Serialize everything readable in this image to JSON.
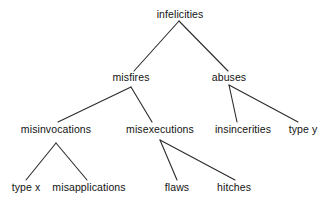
{
  "diagram": {
    "type": "tree",
    "background_color": "#ffffff",
    "line_color": "#2b2b2b",
    "text_color": "#121212",
    "nodes": [
      {
        "id": "infelicities",
        "label": "infelicities",
        "x": 180,
        "y": 14,
        "level": 0
      },
      {
        "id": "misfires",
        "label": "misfires",
        "x": 131,
        "y": 77,
        "level": 1
      },
      {
        "id": "abuses",
        "label": "abuses",
        "x": 229,
        "y": 77,
        "level": 1
      },
      {
        "id": "misinvocations",
        "label": "misinvocations",
        "x": 56,
        "y": 129,
        "level": 2
      },
      {
        "id": "misexecutions",
        "label": "misexecutions",
        "x": 160,
        "y": 129,
        "level": 2
      },
      {
        "id": "insincerities",
        "label": "insincerities",
        "x": 243,
        "y": 129,
        "level": 2
      },
      {
        "id": "type-y",
        "label": "type y",
        "x": 303,
        "y": 129,
        "level": 2
      },
      {
        "id": "type-x",
        "label": "type x",
        "x": 26,
        "y": 187,
        "level": 3
      },
      {
        "id": "misapplications",
        "label": "misapplications",
        "x": 89,
        "y": 187,
        "level": 3
      },
      {
        "id": "flaws",
        "label": "flaws",
        "x": 177,
        "y": 187,
        "level": 3
      },
      {
        "id": "hitches",
        "label": "hitches",
        "x": 234,
        "y": 187,
        "level": 3
      }
    ],
    "edges": [
      {
        "from": "infelicities",
        "to": "misfires",
        "x1": 179,
        "y1": 21,
        "x2": 134,
        "y2": 71
      },
      {
        "from": "infelicities",
        "to": "abuses",
        "x1": 179,
        "y1": 21,
        "x2": 228,
        "y2": 71
      },
      {
        "from": "misfires",
        "to": "misinvocations",
        "x1": 131,
        "y1": 87,
        "x2": 58,
        "y2": 122
      },
      {
        "from": "misfires",
        "to": "misexecutions",
        "x1": 131,
        "y1": 87,
        "x2": 152,
        "y2": 122
      },
      {
        "from": "abuses",
        "to": "insincerities",
        "x1": 229,
        "y1": 85,
        "x2": 237,
        "y2": 122
      },
      {
        "from": "abuses",
        "to": "type-y",
        "x1": 229,
        "y1": 85,
        "x2": 298,
        "y2": 122
      },
      {
        "from": "misinvocations",
        "to": "type-x",
        "x1": 56,
        "y1": 143,
        "x2": 26,
        "y2": 180
      },
      {
        "from": "misinvocations",
        "to": "misapplications",
        "x1": 56,
        "y1": 143,
        "x2": 87,
        "y2": 180
      },
      {
        "from": "misexecutions",
        "to": "flaws",
        "x1": 160,
        "y1": 140,
        "x2": 177,
        "y2": 180
      },
      {
        "from": "misexecutions",
        "to": "hitches",
        "x1": 160,
        "y1": 140,
        "x2": 235,
        "y2": 180
      }
    ]
  }
}
